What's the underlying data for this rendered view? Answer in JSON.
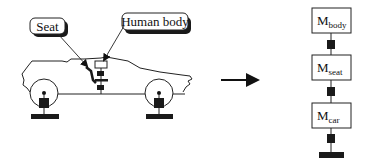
{
  "diagram": {
    "type": "vehicle-occupant vibration model",
    "callouts": {
      "seat": "Seat",
      "human_body": "Human body"
    },
    "transform_arrow": "right-arrow",
    "mass_chain": [
      {
        "symbol": "M",
        "subscript": "body"
      },
      {
        "symbol": "M",
        "subscript": "seat"
      },
      {
        "symbol": "M",
        "subscript": "car"
      }
    ],
    "connectors": [
      "spring-damper",
      "spring-damper",
      "spring-damper"
    ],
    "ground": "ground-base",
    "colors": {
      "stroke": "#222222",
      "fill_dark": "#1a1a1a",
      "background": "#ffffff"
    }
  }
}
